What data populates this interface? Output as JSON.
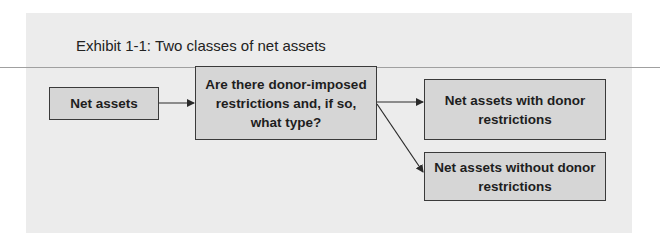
{
  "exhibit": {
    "title": "Exhibit 1-1: Two classes of net assets"
  },
  "diagram": {
    "nodes": [
      {
        "id": "net-assets",
        "label": "Net assets"
      },
      {
        "id": "question",
        "label": "Are there donor-imposed restrictions and, if so, what type?"
      },
      {
        "id": "with-restrictions",
        "label": "Net assets with donor restrictions"
      },
      {
        "id": "without-restrictions",
        "label": "Net assets without donor restrictions"
      }
    ],
    "edges": [
      {
        "from": "net-assets",
        "to": "question"
      },
      {
        "from": "question",
        "to": "with-restrictions"
      },
      {
        "from": "question",
        "to": "without-restrictions"
      }
    ]
  },
  "colors": {
    "panel_background": "#ececec",
    "box_fill": "#d6d6d6",
    "box_border": "#3a3a3a",
    "divider_line": "#a0a0a0"
  }
}
